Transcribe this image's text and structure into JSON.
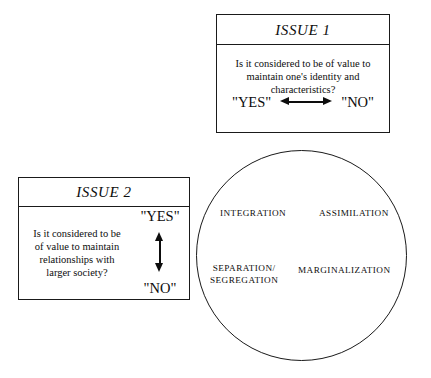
{
  "diagram": {
    "background_color": "#ffffff",
    "line_color": "#1a1a1a",
    "text_color": "#0d0d0d"
  },
  "issue1": {
    "header": "ISSUE 1",
    "question_lines": [
      "Is it considered to be of value to",
      "maintain one's identity and",
      "characteristics?"
    ],
    "yes_label": "\"YES\"",
    "no_label": "\"NO\"",
    "arrow": "horizontal-double-arrow"
  },
  "issue2": {
    "header": "ISSUE 2",
    "question_lines": [
      "Is it considered to be",
      "of value to maintain",
      "relationships with",
      "larger society?"
    ],
    "yes_label": "\"YES\"",
    "no_label": "\"NO\"",
    "arrow": "vertical-double-arrow"
  },
  "strategies": {
    "integration": "INTEGRATION",
    "assimilation": "ASSIMILATION",
    "separation_line1": "SEPARATION/",
    "separation_line2": "SEGREGATION",
    "marginalization": "MARGINALIZATION"
  }
}
